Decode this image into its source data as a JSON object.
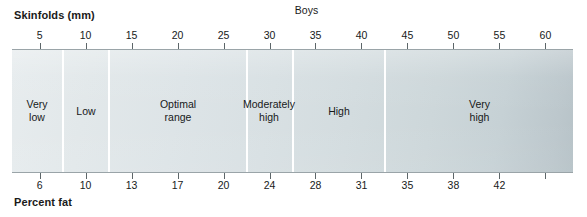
{
  "chart_data": {
    "type": "bar",
    "title": "Boys",
    "subtitle": "",
    "xlabel": "Skinfolds (mm)",
    "ylabel": "",
    "secondary_xlabel": "Percent fat",
    "grid": false,
    "legend_position": "none",
    "orientation": "horizontal-band",
    "xlim": [
      2,
      63
    ],
    "top_axis": {
      "label": "Skinfolds (mm)",
      "ticks": [
        5,
        10,
        15,
        20,
        25,
        30,
        35,
        40,
        45,
        50,
        55,
        60
      ],
      "tick_labels": [
        "5",
        "10",
        "15",
        "20",
        "25",
        "30",
        "35",
        "40",
        "45",
        "50",
        "55",
        "60"
      ]
    },
    "bottom_axis": {
      "label": "Percent fat",
      "ticks": [
        5,
        10,
        15,
        20,
        25,
        30,
        35,
        40,
        45,
        50,
        55,
        60
      ],
      "tick_labels": [
        "6",
        "10",
        "13",
        "17",
        "20",
        "24",
        "28",
        "31",
        "35",
        "38",
        "42",
        ""
      ]
    },
    "categories": [
      "Very low",
      "Low",
      "Optimal range",
      "Moderately high",
      "High",
      "Very high"
    ],
    "bands": [
      {
        "label": "Very low",
        "label_lines": [
          "Very",
          "low"
        ],
        "skinfold_start": 2,
        "skinfold_end": 5,
        "percent_fat_start": null,
        "percent_fat_end": 6
      },
      {
        "label": "Low",
        "label_lines": [
          "Low"
        ],
        "skinfold_start": 5,
        "skinfold_end": 10,
        "percent_fat_start": 6,
        "percent_fat_end": 10
      },
      {
        "label": "Optimal range",
        "label_lines": [
          "Optimal",
          "range"
        ],
        "skinfold_start": 10,
        "skinfold_end": 25,
        "percent_fat_start": 10,
        "percent_fat_end": 20
      },
      {
        "label": "Moderately high",
        "label_lines": [
          "Moderately",
          "high"
        ],
        "skinfold_start": 25,
        "skinfold_end": 30,
        "percent_fat_start": 20,
        "percent_fat_end": 24
      },
      {
        "label": "High",
        "label_lines": [
          "High"
        ],
        "skinfold_start": 30,
        "skinfold_end": 40,
        "percent_fat_start": 24,
        "percent_fat_end": 31
      },
      {
        "label": "Very high",
        "label_lines": [
          "Very",
          "high"
        ],
        "skinfold_start": 40,
        "skinfold_end": 63,
        "percent_fat_start": 31,
        "percent_fat_end": null
      }
    ],
    "dividers_at_skinfold": [
      5,
      10,
      25,
      30,
      40
    ]
  },
  "labels": {
    "title": "Boys",
    "skinfolds_title": "Skinfolds (mm)",
    "percent_fat_title": "Percent fat",
    "top_ticks": [
      "5",
      "10",
      "15",
      "20",
      "25",
      "30",
      "35",
      "40",
      "45",
      "50",
      "55",
      "60"
    ],
    "bottom_ticks": [
      "6",
      "10",
      "13",
      "17",
      "20",
      "24",
      "28",
      "31",
      "35",
      "38",
      "42"
    ],
    "band_labels": {
      "very_low_line1": "Very",
      "very_low_line2": "low",
      "low_line1": "Low",
      "optimal_line1": "Optimal",
      "optimal_line2": "range",
      "moderately_high_line1": "Moderately",
      "moderately_high_line2": "high",
      "high_line1": "High",
      "very_high_line1": "Very",
      "very_high_line2": "high"
    }
  },
  "colors": {
    "band_light": "#e7ecee",
    "band_dark": "#b6c2c7",
    "divider": "#ffffff",
    "axis": "#9aa4a8",
    "tick": "#5d6669",
    "text": "#17191a",
    "background": "#ffffff"
  }
}
